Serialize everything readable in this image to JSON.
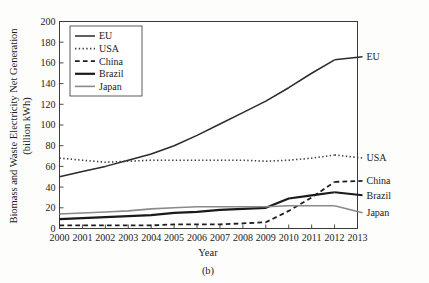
{
  "figure": {
    "caption": "(b)",
    "background": "#fdfdfc"
  },
  "chart_data": {
    "type": "line",
    "title": "",
    "xlabel": "Year",
    "ylabel": "Biomass and Waste Electricity Net Generation",
    "ylabel_units": "(billion kWh)",
    "xlim": [
      2000,
      2013
    ],
    "ylim": [
      0,
      200
    ],
    "ytick_step": 20,
    "grid": true,
    "legend_position": "top-left",
    "x": [
      2000,
      2001,
      2002,
      2003,
      2004,
      2005,
      2006,
      2007,
      2008,
      2009,
      2010,
      2011,
      2012
    ],
    "xtick_labels": [
      "2000",
      "2001",
      "2002",
      "2003",
      "2004",
      "2005",
      "2006",
      "2007",
      "2008",
      "2009",
      "2010",
      "2011",
      "2012",
      "2013"
    ],
    "ytick_labels": [
      "0",
      "20",
      "40",
      "60",
      "80",
      "100",
      "120",
      "140",
      "160",
      "180",
      "200"
    ],
    "series": [
      {
        "name": "EU",
        "style": "solid",
        "color": "#2b2b2b",
        "width": 1.5,
        "end_label": "EU",
        "values": [
          50,
          55,
          60,
          66,
          72,
          80,
          90,
          101,
          112,
          123,
          136,
          150,
          163
        ]
      },
      {
        "name": "USA",
        "style": "dotted",
        "color": "#3a3a3a",
        "width": 1.6,
        "end_label": "USA",
        "values": [
          68,
          66,
          64,
          65,
          66,
          66,
          66,
          66,
          66,
          65,
          66,
          68,
          71
        ]
      },
      {
        "name": "China",
        "style": "dashed",
        "color": "#1f1f1f",
        "width": 1.8,
        "end_label": "China",
        "values": [
          3,
          3,
          3,
          3,
          3,
          4,
          4,
          4,
          5,
          6,
          17,
          30,
          45
        ]
      },
      {
        "name": "Brazil",
        "style": "solid",
        "color": "#1a1a1a",
        "width": 2.2,
        "end_label": "Brazil",
        "values": [
          9,
          10,
          11,
          12,
          13,
          15,
          16,
          18,
          19,
          20,
          29,
          32,
          35
        ]
      },
      {
        "name": "Japan",
        "style": "solid",
        "color": "#8a8a8a",
        "width": 1.6,
        "end_label": "Japan",
        "values": [
          14,
          15,
          16,
          17,
          19,
          20,
          21,
          21,
          21,
          21,
          22,
          22,
          22
        ]
      }
    ],
    "legend_entries": [
      {
        "label": "EU",
        "style": "solid",
        "color": "#2b2b2b",
        "width": 1.5
      },
      {
        "label": "USA",
        "style": "dotted",
        "color": "#3a3a3a",
        "width": 1.6
      },
      {
        "label": "China",
        "style": "dashed",
        "color": "#1f1f1f",
        "width": 1.8
      },
      {
        "label": "Brazil",
        "style": "solid",
        "color": "#1a1a1a",
        "width": 2.2
      },
      {
        "label": "Japan",
        "style": "solid",
        "color": "#8a8a8a",
        "width": 1.6
      }
    ]
  }
}
